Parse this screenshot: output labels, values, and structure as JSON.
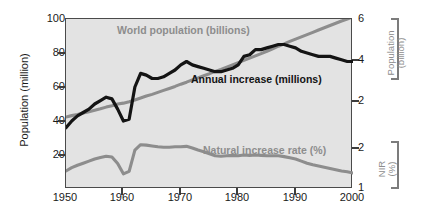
{
  "chart_data": {
    "type": "line",
    "title": "",
    "subtitle": "",
    "xlabel": "",
    "ylabel": "Population (million)",
    "ylabel_right_top": "Population (billion)",
    "ylabel_right_bottom": "NIR (%)",
    "xlim": [
      1950,
      2000
    ],
    "ylim": [
      0,
      100
    ],
    "ylim_right_top": [
      0,
      6
    ],
    "ylim_right_bottom": [
      1,
      2
    ],
    "grid": false,
    "legend": "in-plot annotations",
    "plot_background": "#e3e3e3",
    "xticks": [
      "1950",
      "1960",
      "1970",
      "1980",
      "1990",
      "2000"
    ],
    "xtick_values": [
      1950,
      1960,
      1970,
      1980,
      1990,
      2000
    ],
    "yticks_left": [
      "100",
      "80",
      "60",
      "40",
      "20"
    ],
    "ytick_values_left": [
      100,
      80,
      60,
      40,
      20
    ],
    "yticks_right_top": [
      "6",
      "4",
      "2"
    ],
    "ytick_values_right_top": [
      6,
      4,
      2
    ],
    "yticks_right_bottom": [
      "2",
      "1"
    ],
    "ytick_values_right_bottom": [
      2,
      1
    ],
    "annotations": [
      {
        "text": "World population (billions)",
        "color": "#8d8d8d"
      },
      {
        "text": "Annual increase (millions)",
        "color": "#141414"
      },
      {
        "text": "Natural increase rate (%)",
        "color": "#8d8d8d"
      }
    ],
    "x": [
      1950,
      1951,
      1952,
      1953,
      1954,
      1955,
      1956,
      1957,
      1958,
      1959,
      1960,
      1961,
      1962,
      1963,
      1964,
      1965,
      1966,
      1967,
      1968,
      1969,
      1970,
      1971,
      1972,
      1973,
      1974,
      1975,
      1976,
      1977,
      1978,
      1979,
      1980,
      1981,
      1982,
      1983,
      1984,
      1985,
      1986,
      1987,
      1988,
      1989,
      1990,
      1991,
      1992,
      1993,
      1994,
      1995,
      1996,
      1997,
      1998,
      1999,
      2000
    ],
    "series": [
      {
        "name": "World population (billions)",
        "axis": "right-top",
        "color": "#8d8d8d",
        "unit": "billions",
        "values": [
          2.54,
          2.59,
          2.63,
          2.68,
          2.73,
          2.78,
          2.83,
          2.89,
          2.94,
          3.0,
          3.03,
          3.08,
          3.14,
          3.21,
          3.28,
          3.34,
          3.41,
          3.48,
          3.55,
          3.62,
          3.7,
          3.77,
          3.85,
          3.92,
          4.0,
          4.07,
          4.15,
          4.22,
          4.3,
          4.38,
          4.46,
          4.54,
          4.62,
          4.7,
          4.78,
          4.86,
          4.95,
          5.04,
          5.12,
          5.21,
          5.29,
          5.37,
          5.45,
          5.53,
          5.61,
          5.69,
          5.77,
          5.85,
          5.93,
          6.0,
          6.08
        ]
      },
      {
        "name": "Annual increase (millions)",
        "axis": "left",
        "color": "#141414",
        "unit": "millions",
        "values": [
          36,
          40,
          43,
          45,
          47,
          50,
          52,
          54,
          53,
          47,
          40,
          41,
          60,
          68,
          67,
          65,
          65,
          66,
          68,
          70,
          73,
          75,
          73,
          72,
          71,
          70,
          69,
          69,
          70,
          71,
          73,
          78,
          79,
          82,
          82,
          83,
          84,
          85,
          85,
          84,
          83,
          81,
          80,
          79,
          78,
          78,
          78,
          77,
          76,
          75,
          75
        ]
      },
      {
        "name": "Natural increase rate (%)",
        "axis": "right-bottom",
        "color": "#8d8d8d",
        "unit": "%",
        "values": [
          1.44,
          1.52,
          1.58,
          1.63,
          1.68,
          1.73,
          1.77,
          1.8,
          1.78,
          1.62,
          1.37,
          1.43,
          1.95,
          2.08,
          2.07,
          2.05,
          2.03,
          2.02,
          2.02,
          2.03,
          2.03,
          2.04,
          2.0,
          1.95,
          1.91,
          1.86,
          1.81,
          1.8,
          1.81,
          1.82,
          1.81,
          1.83,
          1.82,
          1.83,
          1.82,
          1.81,
          1.81,
          1.81,
          1.79,
          1.76,
          1.73,
          1.68,
          1.63,
          1.59,
          1.56,
          1.53,
          1.5,
          1.47,
          1.44,
          1.42,
          1.39
        ]
      }
    ]
  },
  "axes": {
    "left_title": "Population (million)",
    "right_top_title_line1": "Population",
    "right_top_title_line2": "(billion)",
    "right_bottom_title_line1": "NIR",
    "right_bottom_title_line2": "(%)"
  }
}
